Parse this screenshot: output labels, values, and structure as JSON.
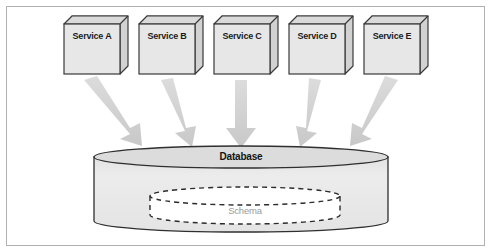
{
  "figure": {
    "width": 491,
    "height": 252,
    "background": "#ffffff",
    "frame_color": "#b0b0b0"
  },
  "colors": {
    "box_fill": "#e7e7e7",
    "box_side_fill": "#d2d2d2",
    "box_stroke": "#3a3a3a",
    "cylinder_fill": "#e9e9e9",
    "cylinder_top_fill": "#dcdcdc",
    "cylinder_stroke": "#2f2f2f",
    "arrow_fill": "#cfcfcf",
    "schema_fill": "#ffffff",
    "schema_stroke": "#2b2b2b",
    "label_dark": "#1c1c1c",
    "label_gray": "#9a9a9a"
  },
  "services": [
    {
      "id": "service-a",
      "label": "Service A",
      "x": 64,
      "y": 16,
      "w": 56,
      "h": 58
    },
    {
      "id": "service-b",
      "label": "Service B",
      "x": 139,
      "y": 16,
      "w": 56,
      "h": 58
    },
    {
      "id": "service-c",
      "label": "Service C",
      "x": 214,
      "y": 16,
      "w": 56,
      "h": 58
    },
    {
      "id": "service-d",
      "label": "Service D",
      "x": 289,
      "y": 16,
      "w": 56,
      "h": 58
    },
    {
      "id": "service-e",
      "label": "Service E",
      "x": 364,
      "y": 16,
      "w": 56,
      "h": 58
    }
  ],
  "database": {
    "id": "database-cylinder",
    "label": "Database",
    "x": 94,
    "y": 146,
    "w": 294,
    "h": 86,
    "top_ellipse_ry": 11
  },
  "schema": {
    "id": "schema-shape",
    "label": "Schema",
    "x": 150,
    "y": 189,
    "w": 190,
    "h": 36,
    "stroke_dash": "5 4"
  },
  "arrows": [
    {
      "id": "arrow-a",
      "from": "service-a",
      "to": "database",
      "x1": 92,
      "y1": 82,
      "x2": 137,
      "y2": 142
    },
    {
      "id": "arrow-b",
      "from": "service-b",
      "to": "database",
      "x1": 167,
      "y1": 82,
      "x2": 190,
      "y2": 142
    },
    {
      "id": "arrow-c",
      "from": "service-c",
      "to": "database",
      "x1": 241,
      "y1": 82,
      "x2": 241,
      "y2": 142
    },
    {
      "id": "arrow-d",
      "from": "service-d",
      "to": "database",
      "x1": 317,
      "y1": 82,
      "x2": 294,
      "y2": 142
    },
    {
      "id": "arrow-e",
      "from": "service-e",
      "to": "database",
      "x1": 392,
      "y1": 82,
      "x2": 347,
      "y2": 142
    }
  ]
}
